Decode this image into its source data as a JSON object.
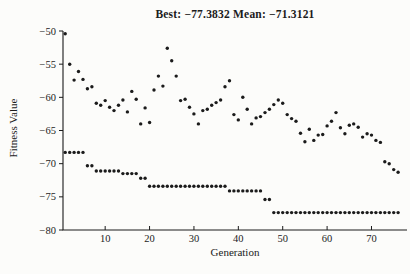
{
  "page": {
    "background": "#fcfcfa",
    "ink_color": "#1b1b1b"
  },
  "chart_data": {
    "type": "scatter",
    "title": "Best: −77.3832 Mean: −71.3121",
    "best_value": -77.3832,
    "mean_value": -71.3121,
    "xlabel": "Generation",
    "ylabel": "Fitness Value",
    "xlim": [
      0.5,
      78
    ],
    "ylim": [
      -80,
      -50
    ],
    "xticks": [
      10,
      20,
      30,
      40,
      50,
      60,
      70
    ],
    "xtick_labels": [
      "10",
      "20",
      "30",
      "40",
      "50",
      "60",
      "70"
    ],
    "yticks": [
      -50,
      -55,
      -60,
      -65,
      -70,
      -75,
      -80
    ],
    "ytick_labels": [
      "−50",
      "−55",
      "−60",
      "−65",
      "−70",
      "−75",
      "−80"
    ],
    "grid": false,
    "legend": "none",
    "marker": {
      "shape": "dot",
      "radius": 1.7,
      "color": "#1b1b1b"
    },
    "x_start": 1,
    "x_step": 1,
    "series": [
      {
        "name": "Best fitness",
        "values": [
          -68.3,
          -68.3,
          -68.3,
          -68.3,
          -68.3,
          -70.3,
          -70.3,
          -71.1,
          -71.1,
          -71.1,
          -71.1,
          -71.1,
          -71.1,
          -71.5,
          -71.5,
          -71.5,
          -71.5,
          -72.2,
          -72.2,
          -73.4,
          -73.4,
          -73.4,
          -73.4,
          -73.4,
          -73.4,
          -73.4,
          -73.4,
          -73.4,
          -73.4,
          -73.4,
          -73.4,
          -73.4,
          -73.4,
          -73.4,
          -73.4,
          -73.4,
          -73.4,
          -74.1,
          -74.1,
          -74.1,
          -74.1,
          -74.1,
          -74.1,
          -74.1,
          -74.1,
          -75.4,
          -75.4,
          -77.38,
          -77.38,
          -77.38,
          -77.38,
          -77.38,
          -77.38,
          -77.38,
          -77.38,
          -77.38,
          -77.38,
          -77.38,
          -77.38,
          -77.38,
          -77.38,
          -77.38,
          -77.38,
          -77.38,
          -77.38,
          -77.38,
          -77.38,
          -77.38,
          -77.38,
          -77.38,
          -77.38,
          -77.38,
          -77.38,
          -77.38,
          -77.38,
          -77.38
        ]
      },
      {
        "name": "Mean fitness",
        "values": [
          -50.4,
          -55.0,
          -57.4,
          -56.1,
          -57.3,
          -58.7,
          -58.4,
          -60.9,
          -61.2,
          -60.5,
          -61.5,
          -62.0,
          -61.2,
          -60.4,
          -62.2,
          -59.1,
          -60.3,
          -64.0,
          -61.6,
          -63.8,
          -58.9,
          -56.8,
          -58.3,
          -52.6,
          -54.5,
          -56.8,
          -60.5,
          -60.3,
          -61.5,
          -62.5,
          -64.0,
          -62.0,
          -61.8,
          -61.2,
          -60.8,
          -60.4,
          -58.4,
          -57.5,
          -62.6,
          -63.4,
          -60.0,
          -61.8,
          -64.0,
          -63.1,
          -62.9,
          -62.3,
          -61.8,
          -61.1,
          -60.4,
          -60.9,
          -62.6,
          -63.2,
          -63.6,
          -65.4,
          -66.7,
          -64.8,
          -66.5,
          -65.7,
          -65.6,
          -64.3,
          -63.6,
          -62.3,
          -64.6,
          -65.5,
          -64.2,
          -64.0,
          -64.5,
          -66.0,
          -65.5,
          -65.7,
          -66.5,
          -66.8,
          -69.7,
          -70.0,
          -70.9,
          -71.3
        ]
      }
    ]
  }
}
